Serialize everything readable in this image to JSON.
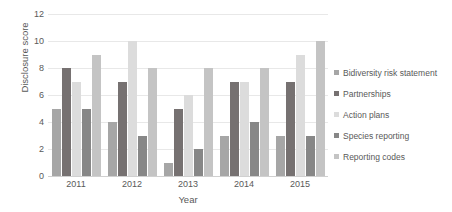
{
  "chart_data": {
    "type": "bar",
    "title": "",
    "xlabel": "Year",
    "ylabel": "Disclosure score",
    "categories": [
      "2011",
      "2012",
      "2013",
      "2014",
      "2015"
    ],
    "ylim": [
      0,
      12
    ],
    "yticks": [
      0,
      2,
      4,
      6,
      8,
      10,
      12
    ],
    "grid": true,
    "legend_position": "right",
    "series": [
      {
        "name": "Bidiversity risk statement",
        "color": "#a6a6a6",
        "values": [
          5,
          4,
          1,
          3,
          3
        ]
      },
      {
        "name": "Partnerships",
        "color": "#767171",
        "values": [
          8,
          7,
          5,
          7,
          7
        ]
      },
      {
        "name": "Action plans",
        "color": "#dcdcdc",
        "values": [
          7,
          10,
          6,
          7,
          9
        ]
      },
      {
        "name": "Species reporting",
        "color": "#878787",
        "values": [
          5,
          3,
          2,
          4,
          3
        ]
      },
      {
        "name": "Reporting codes",
        "color": "#c4c4c4",
        "values": [
          9,
          8,
          8,
          8,
          10
        ]
      }
    ]
  }
}
